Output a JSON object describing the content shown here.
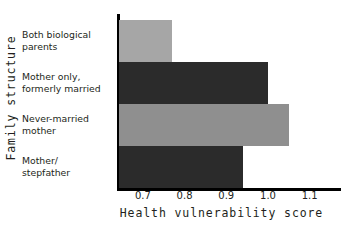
{
  "chart_data": {
    "type": "bar",
    "orientation": "horizontal",
    "title": "",
    "xlabel": "Health vulnerability score",
    "ylabel": "Family structure",
    "categories": [
      "Both biological parents",
      "Mother only, formerly married",
      "Never-married mother",
      "Mother/ stepfather"
    ],
    "values": [
      0.77,
      1.0,
      1.05,
      0.94
    ],
    "xlim": [
      0.638,
      1.175
    ],
    "xticks": [
      0.7,
      0.8,
      0.9,
      1.0,
      1.1
    ],
    "xtick_labels": [
      "0.7",
      "0.8",
      "0.9",
      "1.0",
      "1.1"
    ],
    "grid": false,
    "legend": "none",
    "bar_colors": [
      "#a6a6a6",
      "#2b2b2b",
      "#8f8f8f",
      "#2b2b2b"
    ]
  },
  "axes": {
    "y_title": "Family structure",
    "x_title": "Health vulnerability score"
  },
  "category_lines": [
    [
      "Both biological",
      "parents"
    ],
    [
      "Mother only,",
      "formerly married"
    ],
    [
      "Never-married",
      "mother"
    ],
    [
      "Mother/",
      "stepfather"
    ]
  ],
  "colors": {
    "axis": "#000000",
    "text": "#231f20",
    "background": "#ffffff",
    "bar_light": "#a6a6a6",
    "bar_light_2": "#8f8f8f",
    "bar_dark": "#2b2b2b"
  }
}
